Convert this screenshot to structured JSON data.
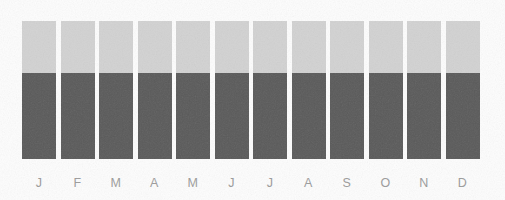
{
  "chart_data": {
    "type": "bar",
    "title": "",
    "subtitle": "",
    "xlabel": "",
    "ylabel": "",
    "stacked": true,
    "grid": false,
    "legend_position": "none",
    "ylim": [
      0,
      100
    ],
    "categories": [
      "J",
      "F",
      "M",
      "A",
      "M",
      "J",
      "J",
      "A",
      "S",
      "O",
      "N",
      "D"
    ],
    "category_names": [
      "January",
      "February",
      "March",
      "April",
      "May",
      "June",
      "July",
      "August",
      "September",
      "October",
      "November",
      "December"
    ],
    "series": [
      {
        "name": "upper-segment",
        "color": "#d2d2d2",
        "values": [
          38,
          38,
          38,
          38,
          38,
          38,
          38,
          38,
          38,
          38,
          38,
          38
        ]
      },
      {
        "name": "lower-segment",
        "color": "#5a5a5a",
        "values": [
          62,
          62,
          62,
          62,
          62,
          62,
          62,
          62,
          62,
          62,
          62,
          62
        ]
      }
    ],
    "totals": [
      100,
      100,
      100,
      100,
      100,
      100,
      100,
      100,
      100,
      100,
      100,
      100
    ]
  },
  "colors": {
    "background": "#fdfdfd",
    "segment_light": "#d2d2d2",
    "segment_dark": "#5a5a5a",
    "axis_label_text": "#9b9b9b"
  }
}
